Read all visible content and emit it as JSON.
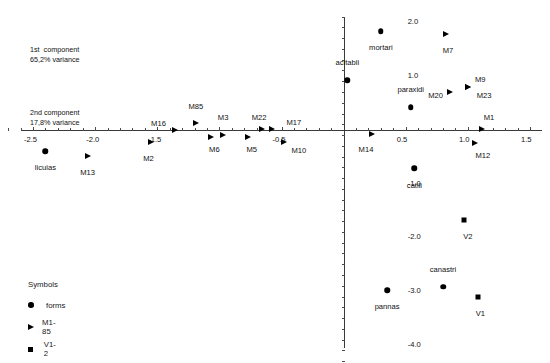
{
  "annotations": {
    "line1_label": "1st  component",
    "line1_value": "65,2% variance",
    "line2_label": "2nd component",
    "line2_value": "17,8% variance"
  },
  "legend": {
    "title": "Symbols",
    "items": [
      {
        "symbol": "circle",
        "label": "forms"
      },
      {
        "symbol": "triangle",
        "label": "M1-85"
      },
      {
        "symbol": "square",
        "label": "V1-2"
      }
    ]
  },
  "chart_data": {
    "type": "scatter",
    "title": "",
    "xlabel": "1st component",
    "ylabel": "2nd component",
    "xlim": [
      -2.75,
      1.62
    ],
    "ylim": [
      -4.35,
      2.3
    ],
    "grid": false,
    "legend_position": "bottom-left",
    "x_ticklabels": [
      "-2.5",
      "-2.0",
      "-1.5",
      "-0.5",
      "0.5",
      "1.0",
      "1.5"
    ],
    "x_tickvalues": [
      -2.5,
      -2.0,
      -1.5,
      -0.5,
      0.5,
      1.0,
      1.5
    ],
    "y_ticklabels": [
      "2.0",
      "1.0",
      "-1.0",
      "-2.0",
      "-3.0",
      "-4.0"
    ],
    "y_tickvalues": [
      2.0,
      1.0,
      -1.0,
      -2.0,
      -3.0,
      -4.0
    ],
    "series": [
      {
        "name": "forms",
        "symbol": "circle",
        "points": [
          {
            "label": "mortari",
            "x": 0.3,
            "y": 1.83,
            "lx": 0.3,
            "ly": 1.52
          },
          {
            "label": "licuias",
            "x": -2.4,
            "y": -0.4,
            "lx": -2.4,
            "ly": -0.72
          },
          {
            "label": "acitabli",
            "x": 0.03,
            "y": 0.92,
            "lx": 0.03,
            "ly": 1.24
          },
          {
            "label": "paraxidi",
            "x": 0.54,
            "y": 0.42,
            "lx": 0.54,
            "ly": 0.74
          },
          {
            "label": "catili",
            "x": 0.57,
            "y": -0.72,
            "lx": 0.57,
            "ly": -1.05
          },
          {
            "label": "pannas",
            "x": 0.35,
            "y": -2.98,
            "lx": 0.35,
            "ly": -3.3
          },
          {
            "label": "canastri",
            "x": 0.8,
            "y": -2.92,
            "lx": 0.8,
            "ly": -2.6
          }
        ]
      },
      {
        "name": "M1-85",
        "symbol": "triangle",
        "points": [
          {
            "label": "M7",
            "x": 0.82,
            "y": 1.78,
            "lx": 0.84,
            "ly": 1.47
          },
          {
            "label": "M9",
            "x": 1.0,
            "y": 0.8,
            "lx": 1.1,
            "ly": 0.92
          },
          {
            "label": "M23",
            "x": 1.0,
            "y": 0.8,
            "lx": 1.13,
            "ly": 0.62
          },
          {
            "label": "M20",
            "x": 0.86,
            "y": 0.7,
            "lx": 0.74,
            "ly": 0.62
          },
          {
            "label": "M85",
            "x": -1.19,
            "y": 0.13,
            "lx": -1.19,
            "ly": 0.42
          },
          {
            "label": "M16",
            "x": -1.36,
            "y": 0.0,
            "lx": -1.49,
            "ly": 0.11
          },
          {
            "label": "M3",
            "x": -0.97,
            "y": -0.1,
            "lx": -0.97,
            "ly": 0.22
          },
          {
            "label": "M22",
            "x": -0.66,
            "y": 0.02,
            "lx": -0.68,
            "ly": 0.22
          },
          {
            "label": "M17",
            "x": -0.58,
            "y": 0.02,
            "lx": -0.4,
            "ly": 0.13
          },
          {
            "label": "M6",
            "x": -1.07,
            "y": -0.14,
            "lx": -1.04,
            "ly": -0.37
          },
          {
            "label": "M5",
            "x": -0.77,
            "y": -0.14,
            "lx": -0.74,
            "ly": -0.37
          },
          {
            "label": "M10",
            "x": -0.48,
            "y": -0.22,
            "lx": -0.36,
            "ly": -0.4
          },
          {
            "label": "M2",
            "x": -1.55,
            "y": -0.22,
            "lx": -1.57,
            "ly": -0.54
          },
          {
            "label": "M13",
            "x": -2.06,
            "y": -0.48,
            "lx": -2.06,
            "ly": -0.8
          },
          {
            "label": "M14",
            "x": 0.23,
            "y": -0.08,
            "lx": 0.18,
            "ly": -0.38
          },
          {
            "label": "M1",
            "x": 1.11,
            "y": 0.02,
            "lx": 1.17,
            "ly": 0.22
          },
          {
            "label": "M12",
            "x": 1.06,
            "y": -0.25,
            "lx": 1.12,
            "ly": -0.48
          }
        ]
      },
      {
        "name": "V1-2",
        "symbol": "square",
        "points": [
          {
            "label": "V2",
            "x": 0.97,
            "y": -1.68,
            "lx": 1.0,
            "ly": -2.0
          },
          {
            "label": "V1",
            "x": 1.08,
            "y": -3.1,
            "lx": 1.1,
            "ly": -3.42
          }
        ]
      }
    ]
  }
}
